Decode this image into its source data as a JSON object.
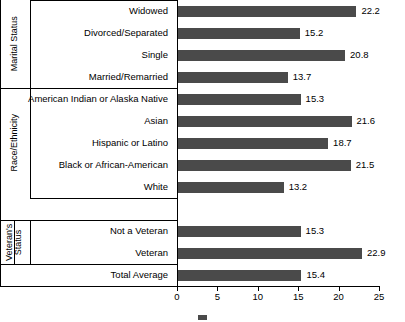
{
  "chart_data": {
    "type": "bar",
    "orientation": "horizontal",
    "title": "",
    "xlabel": "",
    "ylabel": "",
    "xlim": [
      0,
      25
    ],
    "xticks": [
      0,
      5,
      10,
      15,
      20,
      25
    ],
    "grid": false,
    "legend_position": "bottom",
    "bar_color": "#4a4a4a",
    "categories": [
      "Widowed",
      "Divorced/Separated",
      "Single",
      "Married/Remarried",
      "American Indian or Alaska Native",
      "Asian",
      "Hispanic or Latino",
      "Black or African-American",
      "White",
      "Not a Veteran",
      "Veteran",
      "Total Average"
    ],
    "values": [
      22.2,
      15.2,
      20.8,
      13.7,
      15.3,
      21.6,
      18.7,
      21.5,
      13.2,
      15.3,
      22.9,
      15.4
    ],
    "groups": [
      {
        "label": "Marital Status",
        "categories": [
          "Widowed",
          "Divorced/Separated",
          "Single",
          "Married/Remarried"
        ]
      },
      {
        "label": "Race/Ethnicity",
        "categories": [
          "American Indian or Alaska Native",
          "Asian",
          "Hispanic or Latino",
          "Black or African-American",
          "White"
        ]
      },
      {
        "label": "Veteran's Status",
        "categories": [
          "Not a Veteran",
          "Veteran"
        ]
      },
      {
        "label": "",
        "categories": [
          "Total Average"
        ]
      }
    ]
  },
  "axis": {
    "tick_labels": [
      "0",
      "5",
      "10",
      "15",
      "20",
      "25"
    ]
  },
  "group_labels": {
    "marital": "Marital Status",
    "race": "Race/Ethnicity",
    "veteran": "Veteran's Status"
  },
  "legend": {
    "items": []
  }
}
